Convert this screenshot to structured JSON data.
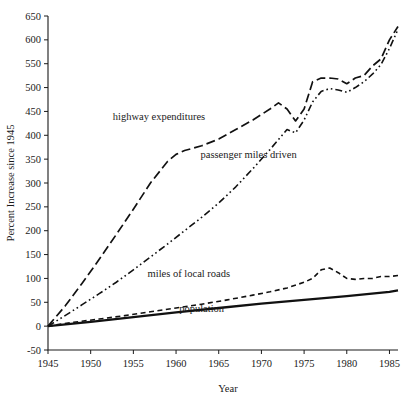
{
  "chart_data": {
    "type": "line",
    "title": "",
    "xlabel": "Year",
    "ylabel": "Percent Increase since 1945",
    "xlim": [
      1945,
      1986
    ],
    "ylim": [
      -50,
      650
    ],
    "xticks": [
      1945,
      1950,
      1955,
      1960,
      1965,
      1970,
      1975,
      1980,
      1985
    ],
    "xtick_labels": [
      "1945",
      "1950",
      "1955",
      "1960",
      "1965",
      "1970",
      "1975",
      "1980",
      "1985"
    ],
    "yticks": [
      -50,
      0,
      50,
      100,
      150,
      200,
      250,
      300,
      350,
      400,
      450,
      500,
      550,
      600,
      650
    ],
    "ytick_labels": [
      "-50",
      "0",
      "50",
      "100",
      "150",
      "200",
      "250",
      "300",
      "350",
      "400",
      "450",
      "500",
      "550",
      "600",
      "650"
    ],
    "grid": false,
    "legend": "inline-annotations",
    "series": [
      {
        "name": "highway expenditures",
        "style": "long-dash",
        "label_x": 1958.0,
        "label_y": 432,
        "x": [
          1945,
          1947,
          1949,
          1951,
          1953,
          1955,
          1957,
          1959,
          1960,
          1961,
          1963,
          1965,
          1967,
          1969,
          1971,
          1972,
          1973,
          1974,
          1975,
          1976,
          1977,
          1978,
          1979,
          1980,
          1981,
          1982,
          1983,
          1984,
          1985,
          1986
        ],
        "y": [
          0,
          42,
          90,
          140,
          192,
          245,
          300,
          345,
          360,
          368,
          378,
          392,
          412,
          432,
          455,
          468,
          455,
          430,
          455,
          512,
          520,
          520,
          518,
          508,
          520,
          525,
          545,
          560,
          600,
          628
        ]
      },
      {
        "name": "passenger miles driven",
        "style": "dash-dot-dot",
        "label_x": 1968.5,
        "label_y": 352,
        "x": [
          1945,
          1947,
          1949,
          1951,
          1953,
          1955,
          1957,
          1959,
          1961,
          1963,
          1965,
          1967,
          1969,
          1971,
          1973,
          1974,
          1975,
          1976,
          1977,
          1978,
          1979,
          1980,
          1981,
          1982,
          1983,
          1984,
          1985,
          1986
        ],
        "y": [
          0,
          22,
          45,
          68,
          92,
          118,
          145,
          172,
          200,
          228,
          258,
          292,
          330,
          370,
          412,
          405,
          432,
          470,
          492,
          498,
          495,
          490,
          500,
          512,
          528,
          548,
          582,
          622
        ]
      },
      {
        "name": "miles of local roads",
        "style": "short-dash",
        "label_x": 1961.5,
        "label_y": 102,
        "x": [
          1945,
          1948,
          1951,
          1954,
          1957,
          1960,
          1963,
          1966,
          1969,
          1971,
          1973,
          1975,
          1976,
          1977,
          1978,
          1979,
          1980,
          1981,
          1982,
          1983,
          1984,
          1985,
          1986
        ],
        "y": [
          0,
          8,
          15,
          22,
          30,
          38,
          46,
          55,
          65,
          72,
          80,
          92,
          100,
          118,
          122,
          112,
          100,
          98,
          100,
          100,
          104,
          104,
          106
        ]
      },
      {
        "name": "population",
        "style": "solid",
        "label_x": 1963.0,
        "label_y": 30,
        "x": [
          1945,
          1950,
          1955,
          1960,
          1965,
          1970,
          1975,
          1980,
          1985,
          1986
        ],
        "y": [
          0,
          9,
          19,
          29,
          38,
          47,
          55,
          63,
          72,
          75
        ]
      }
    ]
  }
}
